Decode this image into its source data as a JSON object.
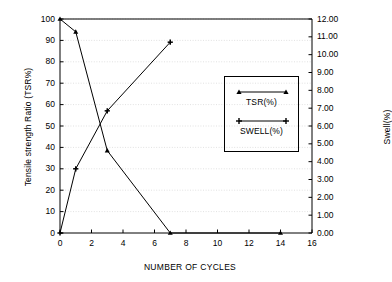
{
  "chart_data": {
    "type": "line",
    "title": "",
    "xlabel": "NUMBER OF CYCLES",
    "ylabel": "Tensile strength Ratio (TSR%)",
    "y2label": "Swell(%)",
    "xlim": [
      0,
      16
    ],
    "ylim": [
      0,
      100
    ],
    "y2lim": [
      0,
      12
    ],
    "xticks": [
      0,
      2,
      4,
      6,
      8,
      10,
      12,
      14,
      16
    ],
    "xtick_labels": [
      "0",
      "2",
      "4",
      "6",
      "8",
      "10",
      "12",
      "14",
      "16"
    ],
    "yticks": [
      0,
      10,
      20,
      30,
      40,
      50,
      60,
      70,
      80,
      90,
      100
    ],
    "ytick_labels": [
      "0",
      "10",
      "20",
      "30",
      "40",
      "50",
      "60",
      "70",
      "80",
      "90",
      "100"
    ],
    "y2ticks": [
      0,
      1,
      2,
      3,
      4,
      5,
      6,
      7,
      8,
      9,
      10,
      11,
      12
    ],
    "y2tick_labels": [
      "0.00",
      "1.00",
      "2.00",
      "3.00",
      "4.00",
      "5.00",
      "6.00",
      "7.00",
      "8.00",
      "9.00",
      "10.00",
      "11.00",
      "12.00"
    ],
    "grid": true,
    "grid_color": "#cccccc",
    "legend_position": "center-right",
    "line_color": "#000000",
    "series": [
      {
        "name": "TSR(%)",
        "axis": "left",
        "marker": "triangle",
        "x": [
          0,
          1,
          3,
          7,
          14
        ],
        "values": [
          100,
          94,
          38.5,
          0,
          0
        ]
      },
      {
        "name": "SWELL(%)",
        "axis": "right",
        "marker": "plus",
        "x": [
          0,
          1,
          3,
          7
        ],
        "values": [
          0.0,
          3.6,
          6.85,
          10.7
        ]
      }
    ]
  },
  "axes": {
    "left_title": "Tensile strength Ratio (TSR%)",
    "right_title": "Swell(%)",
    "bottom_title": "NUMBER OF CYCLES"
  },
  "legend": {
    "items": [
      {
        "label": "TSR(%)",
        "marker": "triangle"
      },
      {
        "label": "SWELL(%)",
        "marker": "plus"
      }
    ]
  }
}
